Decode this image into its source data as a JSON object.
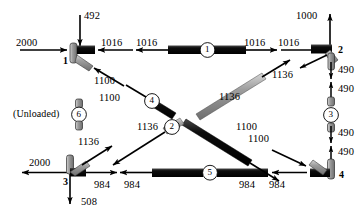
{
  "figure": {
    "type": "truss-free-body-diagram",
    "unloaded_note": "(Unloaded)",
    "colors": {
      "member_dark": "#111111",
      "member_light": "#9a9a9a",
      "arrow": "#000000",
      "background": "#ffffff"
    }
  },
  "joints": [
    {
      "id": "joint-1",
      "label": "1",
      "x": 76,
      "y": 61
    },
    {
      "id": "joint-2",
      "label": "2",
      "x": 337,
      "y": 51
    },
    {
      "id": "joint-3",
      "label": "3",
      "x": 68,
      "y": 186
    },
    {
      "id": "joint-4",
      "label": "4",
      "x": 345,
      "y": 179
    }
  ],
  "members": [
    {
      "id": "member-1",
      "label": "1",
      "cx": 207,
      "cy": 50,
      "orientation": "horizontal"
    },
    {
      "id": "member-2",
      "label": "2",
      "cx": 172,
      "cy": 127,
      "orientation": "diagonal-up-right"
    },
    {
      "id": "member-3",
      "label": "3",
      "cx": 327,
      "cy": 111,
      "orientation": "vertical"
    },
    {
      "id": "member-4",
      "label": "4",
      "cx": 152,
      "cy": 101,
      "orientation": "diagonal-down-right"
    },
    {
      "id": "member-5",
      "label": "5",
      "cx": 210,
      "cy": 172,
      "orientation": "horizontal"
    },
    {
      "id": "member-6",
      "label": "6",
      "cx": 79,
      "cy": 114,
      "orientation": "vertical"
    }
  ],
  "force_labels": [
    {
      "id": "force-492",
      "value": "492",
      "x": 84,
      "y": 11
    },
    {
      "id": "force-2000-top",
      "value": "2000",
      "x": 16,
      "y": 40
    },
    {
      "id": "force-1016-j1r",
      "value": "1016",
      "x": 100,
      "y": 40
    },
    {
      "id": "force-1016-m1l",
      "value": "1016",
      "x": 139,
      "y": 40
    },
    {
      "id": "force-1016-m1r",
      "value": "1016",
      "x": 243,
      "y": 40
    },
    {
      "id": "force-1016-j2l",
      "value": "1016",
      "x": 280,
      "y": 40
    },
    {
      "id": "force-1000",
      "value": "1000",
      "x": 296,
      "y": 11
    },
    {
      "id": "force-1100-j1",
      "value": "1100",
      "x": 93,
      "y": 77
    },
    {
      "id": "force-1100-m4",
      "value": "1100",
      "x": 123,
      "y": 94
    },
    {
      "id": "force-1136-m4",
      "value": "1136",
      "x": 217,
      "y": 93
    },
    {
      "id": "force-1136-j2",
      "value": "1136",
      "x": 282,
      "y": 74
    },
    {
      "id": "force-1136-m2",
      "value": "1136",
      "x": 138,
      "y": 124
    },
    {
      "id": "force-1100-m2",
      "value": "1100",
      "x": 235,
      "y": 123
    },
    {
      "id": "force-490-a",
      "value": "490",
      "x": 340,
      "y": 70
    },
    {
      "id": "force-490-b",
      "value": "490",
      "x": 340,
      "y": 89
    },
    {
      "id": "force-490-c",
      "value": "490",
      "x": 340,
      "y": 133
    },
    {
      "id": "force-490-d",
      "value": "490",
      "x": 340,
      "y": 152
    },
    {
      "id": "force-1136-j3",
      "value": "1136",
      "x": 77,
      "y": 141
    },
    {
      "id": "force-2000-bot",
      "value": "2000",
      "x": 30,
      "y": 157
    },
    {
      "id": "force-984-j3",
      "value": "984",
      "x": 97,
      "y": 186
    },
    {
      "id": "force-984-m5l",
      "value": "984",
      "x": 130,
      "y": 186
    },
    {
      "id": "force-984-m5r",
      "value": "984",
      "x": 240,
      "y": 186
    },
    {
      "id": "force-984-j4",
      "value": "984",
      "x": 273,
      "y": 186
    },
    {
      "id": "force-508",
      "value": "508",
      "x": 82,
      "y": 200
    },
    {
      "id": "force-1100-j4",
      "value": "1100",
      "x": 273,
      "y": 147
    }
  ]
}
